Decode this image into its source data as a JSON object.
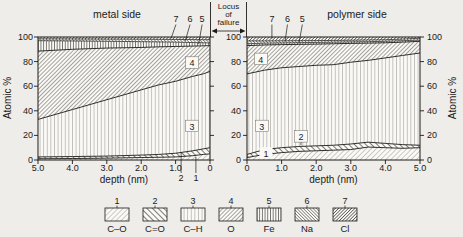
{
  "figure": {
    "locus_label_lines": [
      "Locus",
      "of",
      "failure"
    ]
  },
  "chart_data": [
    {
      "id": "metal",
      "type": "area",
      "title": "metal side",
      "xlabel": "depth (nm)",
      "ylabel": "Atomic %",
      "x_reversed": true,
      "xlim": [
        5.0,
        0
      ],
      "ylim": [
        0,
        100
      ],
      "x_ticks": [
        "5.0",
        "4.0",
        "3.0",
        "2.0",
        "1.0",
        "0"
      ],
      "x_tick_values": [
        5,
        4,
        3,
        2,
        1,
        0
      ],
      "y_ticks": [
        "100",
        "80",
        "60",
        "40",
        "20",
        "0"
      ],
      "y_tick_values": [
        100,
        80,
        60,
        40,
        20,
        0
      ],
      "x": [
        5,
        4,
        3,
        2,
        1.5,
        1,
        0.5,
        0.2,
        0
      ],
      "series": [
        {
          "band": 1,
          "name": "C–O",
          "cumulative_top_pct": [
            1,
            1.2,
            1.5,
            2,
            2.2,
            2.5,
            3.5,
            4.5,
            5
          ]
        },
        {
          "band": 2,
          "name": "C=O",
          "cumulative_top_pct": [
            2.5,
            2.8,
            3.2,
            4,
            4.5,
            5.5,
            7.5,
            9,
            10
          ]
        },
        {
          "band": 3,
          "name": "C–H",
          "cumulative_top_pct": [
            33,
            41,
            49,
            57,
            61,
            64,
            68,
            70,
            72
          ]
        },
        {
          "band": 4,
          "name": "O",
          "cumulative_top_pct": [
            88.5,
            90,
            91,
            91.5,
            92,
            92.3,
            92.6,
            92.8,
            93
          ]
        },
        {
          "band": 5,
          "name": "Fe",
          "cumulative_top_pct": [
            97,
            96.8,
            96.5,
            96.2,
            96,
            95.8,
            95.5,
            95.3,
            95.2
          ]
        },
        {
          "band": 6,
          "name": "Na",
          "cumulative_top_pct": [
            98.5,
            98.4,
            98.3,
            98.2,
            98.1,
            98,
            97.9,
            97.8,
            97.8
          ]
        },
        {
          "band": 7,
          "name": "Cl",
          "cumulative_top_pct": [
            100,
            100,
            100,
            100,
            100,
            100,
            100,
            100,
            100
          ]
        }
      ],
      "in_plot_labels": [
        {
          "text": "4",
          "x_nm": 0.52,
          "pct": 79,
          "boxed": true
        },
        {
          "text": "3",
          "x_nm": 0.52,
          "pct": 27.5,
          "boxed": true
        }
      ],
      "top_labels": [
        {
          "text": "7",
          "x_nm": 0.99,
          "leader_x_nm": 1.13,
          "leader_pct": 99
        },
        {
          "text": "6",
          "x_nm": 0.58,
          "leader_x_nm": 0.72,
          "leader_pct": 96.8
        },
        {
          "text": "5",
          "x_nm": 0.23,
          "leader_x_nm": 0.33,
          "leader_pct": 94.2
        }
      ],
      "below_axis_labels": [
        {
          "text": "2",
          "x_nm": 0.84,
          "leader_pct": 6.5
        },
        {
          "text": "1",
          "x_nm": 0.41,
          "leader_pct": 2.5
        }
      ]
    },
    {
      "id": "polymer",
      "type": "area",
      "title": "polymer side",
      "xlabel": "depth (nm)",
      "ylabel": "Atomic %",
      "x_reversed": false,
      "xlim": [
        0,
        5.0
      ],
      "ylim": [
        0,
        100
      ],
      "x_ticks": [
        "0",
        "1.0",
        "2.0",
        "3.0",
        "4.0",
        "5.0"
      ],
      "x_tick_values": [
        0,
        1,
        2,
        3,
        4,
        5
      ],
      "y_ticks": [
        "100",
        "80",
        "60",
        "40",
        "20",
        "0"
      ],
      "y_tick_values": [
        100,
        80,
        60,
        40,
        20,
        0
      ],
      "x": [
        0,
        0.5,
        1,
        1.5,
        2,
        2.5,
        3,
        3.5,
        4,
        4.5,
        5
      ],
      "series": [
        {
          "band": 1,
          "name": "C–O",
          "cumulative_top_pct": [
            2,
            4.5,
            6,
            7,
            7.5,
            8,
            8.5,
            10.5,
            10,
            9.5,
            10
          ]
        },
        {
          "band": 2,
          "name": "C=O",
          "cumulative_top_pct": [
            4.5,
            8.5,
            10,
            11,
            11.5,
            12,
            13,
            14.5,
            13.5,
            12.5,
            12
          ]
        },
        {
          "band": 3,
          "name": "C–H",
          "cumulative_top_pct": [
            70,
            73,
            75,
            76,
            77,
            77.5,
            79.5,
            81,
            83,
            85,
            87
          ]
        },
        {
          "band": 4,
          "name": "O",
          "cumulative_top_pct": [
            93,
            93.5,
            93.8,
            94,
            94.2,
            94.5,
            94.8,
            95,
            95.3,
            95.8,
            96.5
          ]
        },
        {
          "band": 5,
          "name": "Fe",
          "cumulative_top_pct": [
            94.5,
            95,
            95.2,
            95.4,
            95.6,
            95.8,
            96,
            96.2,
            96.5,
            97,
            97.5
          ]
        },
        {
          "band": 6,
          "name": "Na",
          "cumulative_top_pct": [
            96.8,
            96.8,
            96.9,
            97,
            97.1,
            97.2,
            97.4,
            97.6,
            97.8,
            98.3,
            99
          ]
        },
        {
          "band": 7,
          "name": "Cl",
          "cumulative_top_pct": [
            100,
            100,
            100,
            100,
            100,
            100,
            100,
            100,
            100,
            100,
            100
          ]
        }
      ],
      "in_plot_labels": [
        {
          "text": "4",
          "x_nm": 0.4,
          "pct": 82,
          "boxed": true
        },
        {
          "text": "3",
          "x_nm": 0.43,
          "pct": 27.5,
          "boxed": true
        },
        {
          "text": "2",
          "x_nm": 1.56,
          "pct": 19,
          "boxed": true,
          "leader_pct": 12
        },
        {
          "text": "1",
          "x_nm": 0.55,
          "pct": 5.5,
          "boxed": false
        }
      ],
      "top_labels": [
        {
          "text": "7",
          "x_nm": 0.72,
          "leader_x_nm": 0.72,
          "leader_pct": 98.8
        },
        {
          "text": "6",
          "x_nm": 1.17,
          "leader_x_nm": 1.1,
          "leader_pct": 96.3
        },
        {
          "text": "5",
          "x_nm": 1.6,
          "leader_x_nm": 1.5,
          "leader_pct": 94.8
        }
      ],
      "below_axis_labels": []
    }
  ],
  "legend": {
    "items": [
      {
        "number": "1",
        "label": "C–O",
        "pattern": "diag-up-light"
      },
      {
        "number": "2",
        "label": "C=O",
        "pattern": "diag-down-bold"
      },
      {
        "number": "3",
        "label": "C–H",
        "pattern": "vertical-light"
      },
      {
        "number": "4",
        "label": "O",
        "pattern": "diag-up-medium"
      },
      {
        "number": "5",
        "label": "Fe",
        "pattern": "vertical-bold"
      },
      {
        "number": "6",
        "label": "Na",
        "pattern": "diag-down-dense"
      },
      {
        "number": "7",
        "label": "Cl",
        "pattern": "diag-up-dense"
      }
    ]
  }
}
